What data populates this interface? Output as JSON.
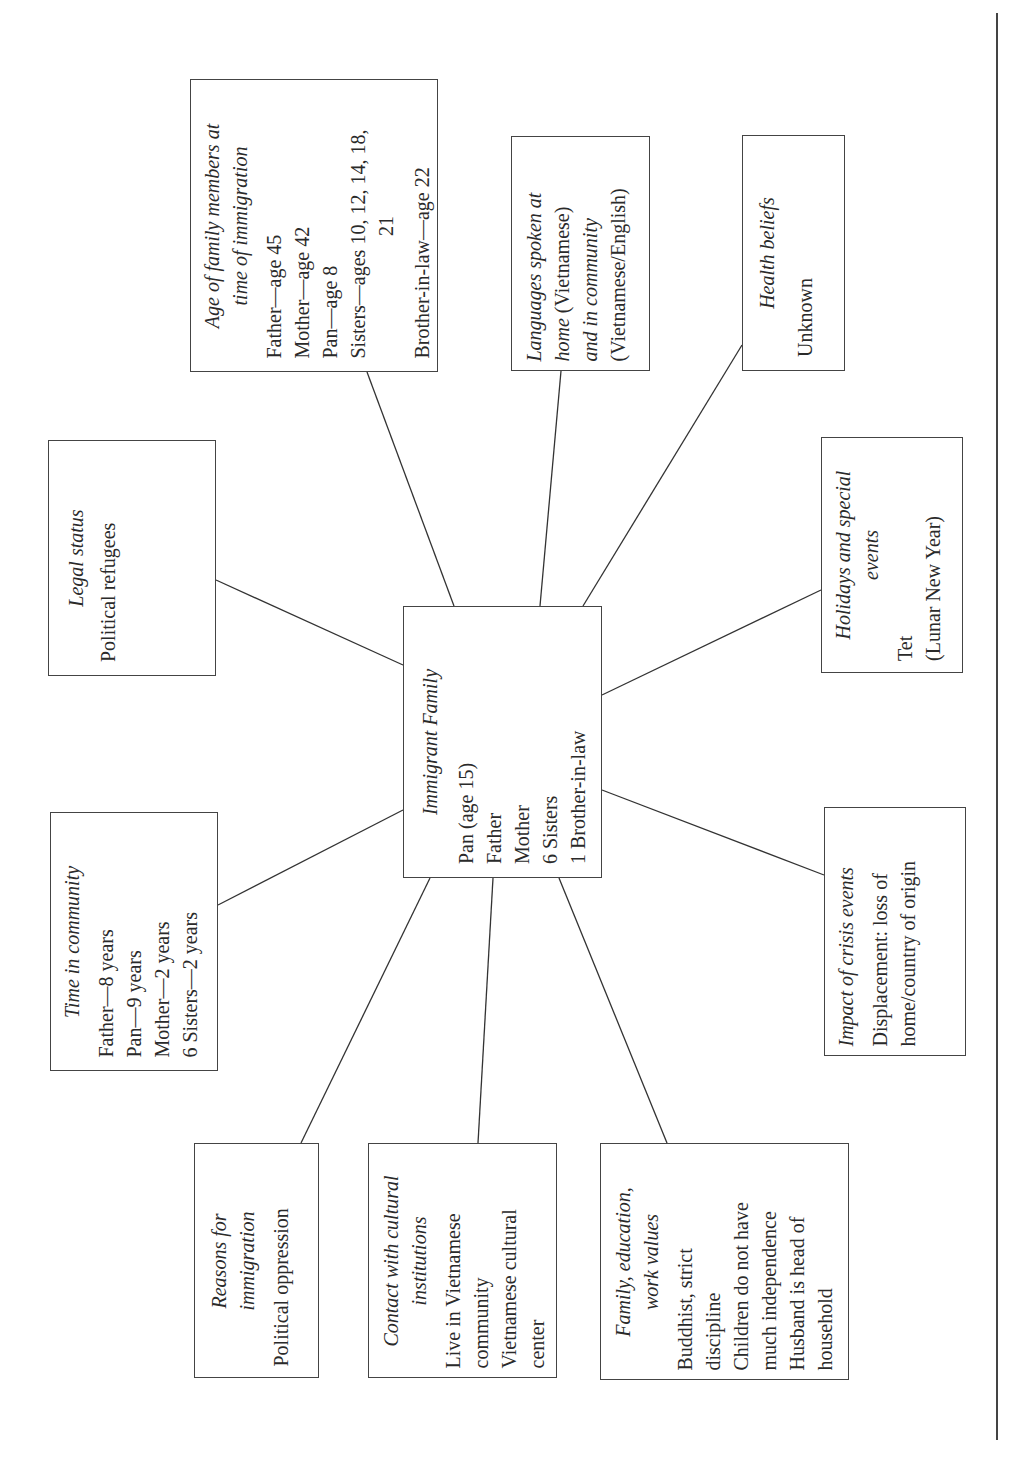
{
  "center": {
    "title": "Immigrant Family",
    "lines": [
      "Pan (age 15)",
      "Father",
      "Mother",
      "6 Sisters",
      "1 Brother-in-law"
    ]
  },
  "nodes": {
    "age": {
      "title_1": "Age of family members at",
      "title_2": "time of immigration",
      "lines": [
        "Father—age 45",
        "Mother—age 42",
        "Pan—age 8",
        "Sisters—ages 10, 12, 14, 18,",
        "21",
        "Brother-in-law—age 22"
      ]
    },
    "languages": {
      "lines": [
        "Languages spoken at",
        "home",
        " (Vietnamese)",
        "and in community",
        "(Vietnamese/English)"
      ]
    },
    "health": {
      "title": "Health beliefs",
      "lines": [
        "Unknown"
      ]
    },
    "legal": {
      "title": "Legal status",
      "lines": [
        "Political refugees"
      ]
    },
    "holidays": {
      "title_1": "Holidays and special",
      "title_2": "events",
      "lines": [
        "Tet",
        "(Lunar New Year)"
      ]
    },
    "time": {
      "title": "Time in community",
      "lines": [
        "Father—8 years",
        "Pan—9 years",
        "Mother—2 years",
        "6 Sisters—2 years"
      ]
    },
    "impact": {
      "title": "Impact of crisis events",
      "lines": [
        "Displacement: loss of",
        "home/country of origin"
      ]
    },
    "reasons": {
      "title_1": "Reasons for",
      "title_2": "immigration",
      "lines": [
        "Political oppression"
      ]
    },
    "contact": {
      "title_1": "Contact with cultural",
      "title_2": "institutions",
      "lines": [
        "Live in Vietnamese",
        "community",
        "Vietnamese cultural",
        "center"
      ]
    },
    "family": {
      "title_1": "Family, education,",
      "title_2": "work values",
      "lines": [
        "Buddhist, strict",
        "discipline",
        "Children do not have",
        "much independence",
        "Husband is head of",
        "household"
      ]
    }
  }
}
